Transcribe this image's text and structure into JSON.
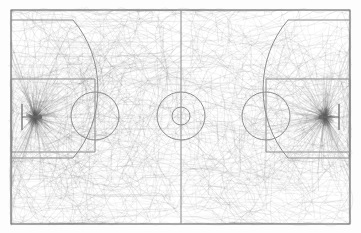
{
  "figure": {
    "title": "",
    "background_color": "#fdfdfd",
    "line_color": "#8e8e8e",
    "trajectory_color": "#5d5d5d",
    "width_px": 361,
    "height_px": 233
  },
  "court": {
    "label": "full-basketball-court",
    "orientation": "horizontal",
    "boundary": {
      "x": 11,
      "y": 10,
      "width": 339,
      "height": 214
    },
    "halfcourt_line_x": 181,
    "center_circle": {
      "cx": 181,
      "cy": 116,
      "outer_r": 24,
      "inner_r": 9
    },
    "left_basket": {
      "key": {
        "x": 11,
        "y": 79,
        "width": 84,
        "height": 73
      },
      "free_throw_circle": {
        "cx": 95,
        "cy": 116,
        "r": 24
      },
      "hoop": {
        "cx": 40,
        "cy": 117,
        "r": 2.2
      },
      "backboard_x": 22,
      "three_point_top_y": 20,
      "three_point_bottom_y": 158,
      "three_point_straight_end_x": 73,
      "three_point_apex_x": 128
    },
    "right_basket": {
      "key": {
        "x": 266,
        "y": 79,
        "width": 84,
        "height": 73
      },
      "free_throw_circle": {
        "cx": 266,
        "cy": 116,
        "r": 24
      },
      "hoop": {
        "cx": 321,
        "cy": 117,
        "r": 2.2
      },
      "backboard_x": 339,
      "three_point_top_y": 20,
      "three_point_bottom_y": 158,
      "three_point_straight_end_x": 288,
      "three_point_apex_x": 233
    }
  },
  "chart_data": {
    "type": "scatter",
    "title": "",
    "subtitle": "",
    "xlabel": "",
    "ylabel": "",
    "plot_kind": "trajectory-overlay",
    "legend_position": "none",
    "grid": false,
    "xlim": [
      0,
      361
    ],
    "ylim": [
      0,
      233
    ],
    "density_hotspots": [
      {
        "name": "left-rim-hotspot",
        "x": 35,
        "y": 117,
        "intensity": 1.0
      },
      {
        "name": "right-rim-hotspot",
        "x": 325,
        "y": 117,
        "intensity": 1.0
      },
      {
        "name": "left-free-throw-hotspot",
        "x": 95,
        "y": 116,
        "intensity": 0.45
      },
      {
        "name": "right-free-throw-hotspot",
        "x": 266,
        "y": 116,
        "intensity": 0.45
      },
      {
        "name": "center-court",
        "x": 181,
        "y": 116,
        "intensity": 0.3
      }
    ],
    "series": [
      {
        "name": "trajectories",
        "count": 900,
        "color": "#5d5d5d",
        "mean_opacity": 0.16,
        "stroke_width": 0.45
      }
    ]
  }
}
